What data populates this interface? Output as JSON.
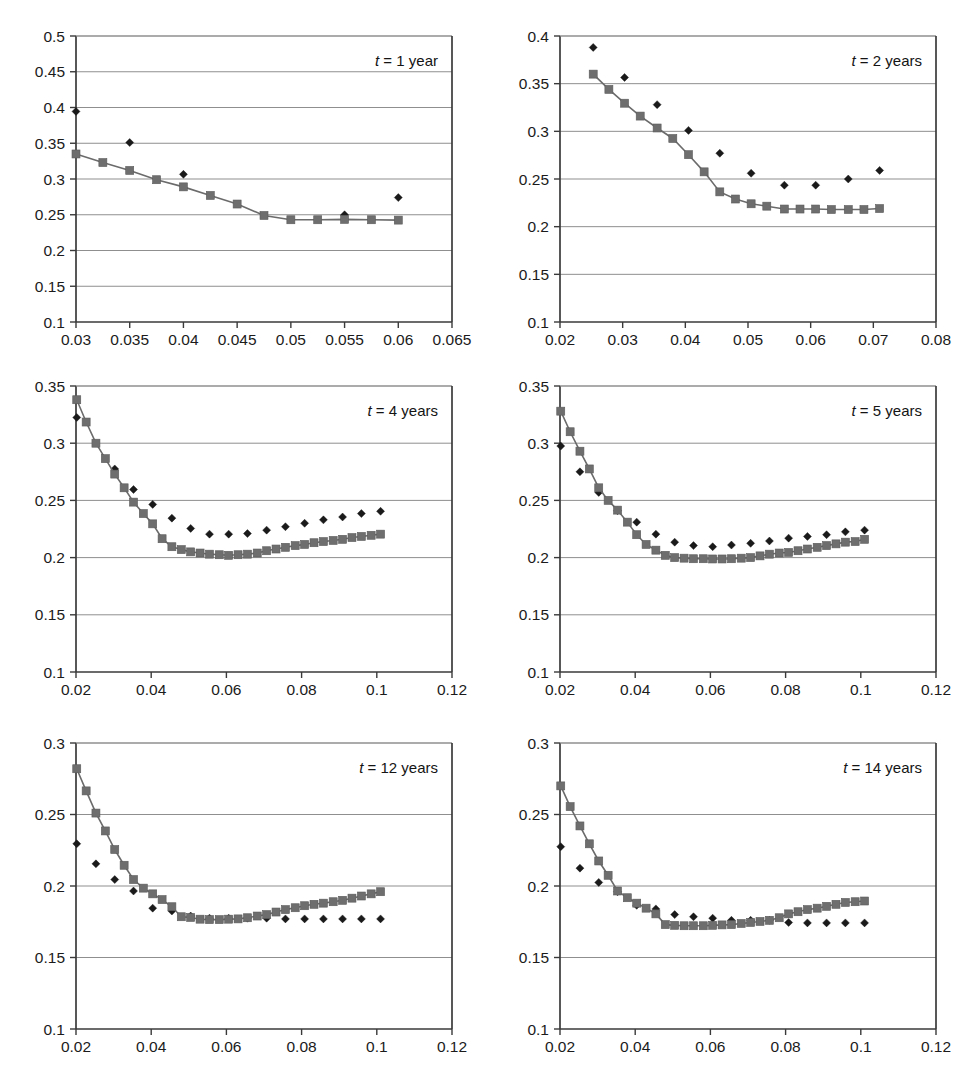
{
  "figure": {
    "kind": "multi-panel-scatter-line-figure",
    "panel_count": 6,
    "colors": {
      "diamond_series": "#1a1a1a",
      "square_series": "#6e6e6e",
      "line": "#6b6b6b",
      "gridline": "#8f8f8f",
      "axis": "#3a3a3a",
      "background": "#ffffff"
    }
  },
  "chart_data": [
    {
      "id": "panel-t-1-year",
      "type": "scatter",
      "title": "t = 1 year",
      "title_parts": {
        "symbol": "t",
        "rest": " = 1 year"
      },
      "xlabel": "",
      "ylabel": "",
      "xlim": [
        0.03,
        0.065
      ],
      "ylim": [
        0.1,
        0.5
      ],
      "xticks": [
        0.03,
        0.035,
        0.04,
        0.045,
        0.05,
        0.055,
        0.06,
        0.065
      ],
      "xtick_labels": [
        "0.03",
        "0.035",
        "0.04",
        "0.045",
        "0.05",
        "0.055",
        "0.06",
        "0.065"
      ],
      "yticks": [
        0.1,
        0.15,
        0.2,
        0.25,
        0.3,
        0.35,
        0.4,
        0.45,
        0.5
      ],
      "ytick_labels": [
        "0.1",
        "0.15",
        "0.2",
        "0.25",
        "0.3",
        "0.35",
        "0.4",
        "0.45",
        "0.5"
      ],
      "grid": true,
      "legend": "none",
      "series": [
        {
          "name": "market-implied",
          "marker": "diamond",
          "line": false,
          "x": [
            0.03,
            0.035,
            0.04,
            0.055,
            0.06
          ],
          "y": [
            0.3945,
            0.351,
            0.3065,
            0.25,
            0.274
          ]
        },
        {
          "name": "model-fit",
          "marker": "square",
          "line": true,
          "x": [
            0.03,
            0.0325,
            0.035,
            0.0375,
            0.04,
            0.0425,
            0.045,
            0.0475,
            0.05,
            0.0525,
            0.055,
            0.0575,
            0.06
          ],
          "y": [
            0.335,
            0.323,
            0.312,
            0.299,
            0.289,
            0.277,
            0.265,
            0.249,
            0.243,
            0.243,
            0.2435,
            0.243,
            0.2425
          ]
        }
      ]
    },
    {
      "id": "panel-t-2-years",
      "type": "scatter",
      "title": "t = 2 years",
      "title_parts": {
        "symbol": "t",
        "rest": " = 2 years"
      },
      "xlabel": "",
      "ylabel": "",
      "xlim": [
        0.02,
        0.08
      ],
      "ylim": [
        0.1,
        0.4
      ],
      "xticks": [
        0.02,
        0.03,
        0.04,
        0.05,
        0.06,
        0.07,
        0.08
      ],
      "xtick_labels": [
        "0.02",
        "0.03",
        "0.04",
        "0.05",
        "0.06",
        "0.07",
        "0.08"
      ],
      "yticks": [
        0.1,
        0.15,
        0.2,
        0.25,
        0.3,
        0.35,
        0.4
      ],
      "ytick_labels": [
        "0.1",
        "0.15",
        "0.2",
        "0.25",
        "0.3",
        "0.35",
        "0.4"
      ],
      "grid": true,
      "legend": "none",
      "series": [
        {
          "name": "market-implied",
          "marker": "diamond",
          "line": false,
          "x": [
            0.0253,
            0.0303,
            0.0355,
            0.0405,
            0.0455,
            0.0505,
            0.0558,
            0.0608,
            0.066,
            0.071
          ],
          "y": [
            0.388,
            0.3565,
            0.328,
            0.301,
            0.277,
            0.256,
            0.2435,
            0.2435,
            0.25,
            0.259
          ]
        },
        {
          "name": "model-fit",
          "marker": "square",
          "line": true,
          "x": [
            0.0253,
            0.0278,
            0.0303,
            0.0328,
            0.0355,
            0.038,
            0.0405,
            0.043,
            0.0455,
            0.048,
            0.0505,
            0.053,
            0.0558,
            0.0583,
            0.0608,
            0.0633,
            0.066,
            0.0685,
            0.071
          ],
          "y": [
            0.36,
            0.344,
            0.3295,
            0.316,
            0.3035,
            0.2925,
            0.2755,
            0.2575,
            0.2365,
            0.229,
            0.224,
            0.2215,
            0.2185,
            0.2185,
            0.2185,
            0.218,
            0.218,
            0.218,
            0.219
          ]
        }
      ]
    },
    {
      "id": "panel-t-4-years",
      "type": "scatter",
      "title": "t = 4 years",
      "title_parts": {
        "symbol": "t",
        "rest": " = 4 years"
      },
      "xlabel": "",
      "ylabel": "",
      "xlim": [
        0.02,
        0.12
      ],
      "ylim": [
        0.1,
        0.35
      ],
      "xticks": [
        0.02,
        0.04,
        0.06,
        0.08,
        0.1,
        0.12
      ],
      "xtick_labels": [
        "0.02",
        "0.04",
        "0.06",
        "0.08",
        "0.1",
        "0.12"
      ],
      "yticks": [
        0.1,
        0.15,
        0.2,
        0.25,
        0.3,
        0.35
      ],
      "ytick_labels": [
        "0.1",
        "0.15",
        "0.2",
        "0.25",
        "0.3",
        "0.35"
      ],
      "grid": true,
      "legend": "none",
      "series": [
        {
          "name": "market-implied",
          "marker": "diamond",
          "line": false,
          "x": [
            0.0202,
            0.0303,
            0.0353,
            0.0404,
            0.0455,
            0.0505,
            0.0555,
            0.0606,
            0.0656,
            0.0707,
            0.0757,
            0.0808,
            0.0858,
            0.0909,
            0.0959,
            0.101
          ],
          "y": [
            0.3225,
            0.2775,
            0.2595,
            0.2465,
            0.2345,
            0.2255,
            0.2205,
            0.2205,
            0.221,
            0.224,
            0.227,
            0.23,
            0.233,
            0.2355,
            0.2385,
            0.2405
          ]
        },
        {
          "name": "model-fit",
          "marker": "square",
          "line": true,
          "x": [
            0.0202,
            0.0227,
            0.0253,
            0.0278,
            0.0303,
            0.0328,
            0.0353,
            0.0379,
            0.0404,
            0.0429,
            0.0455,
            0.048,
            0.0505,
            0.053,
            0.0555,
            0.0581,
            0.0606,
            0.0631,
            0.0656,
            0.0682,
            0.0707,
            0.0732,
            0.0757,
            0.0783,
            0.0808,
            0.0833,
            0.0858,
            0.0884,
            0.0909,
            0.0934,
            0.0959,
            0.0985,
            0.101
          ],
          "y": [
            0.338,
            0.3185,
            0.3,
            0.2865,
            0.273,
            0.261,
            0.2485,
            0.2385,
            0.2295,
            0.2165,
            0.2095,
            0.207,
            0.205,
            0.204,
            0.203,
            0.2025,
            0.202,
            0.2025,
            0.203,
            0.204,
            0.206,
            0.2075,
            0.209,
            0.2105,
            0.2115,
            0.213,
            0.214,
            0.215,
            0.216,
            0.2175,
            0.2185,
            0.2195,
            0.2205
          ]
        }
      ]
    },
    {
      "id": "panel-t-5-years",
      "type": "scatter",
      "title": "t = 5 years",
      "title_parts": {
        "symbol": "t",
        "rest": " = 5 years"
      },
      "xlabel": "",
      "ylabel": "",
      "xlim": [
        0.02,
        0.12
      ],
      "ylim": [
        0.1,
        0.35
      ],
      "xticks": [
        0.02,
        0.04,
        0.06,
        0.08,
        0.1,
        0.12
      ],
      "xtick_labels": [
        "0.02",
        "0.04",
        "0.06",
        "0.08",
        "0.1",
        "0.12"
      ],
      "yticks": [
        0.1,
        0.15,
        0.2,
        0.25,
        0.3,
        0.35
      ],
      "ytick_labels": [
        "0.1",
        "0.15",
        "0.2",
        "0.25",
        "0.3",
        "0.35"
      ],
      "grid": true,
      "legend": "none",
      "series": [
        {
          "name": "market-implied",
          "marker": "diamond",
          "line": false,
          "x": [
            0.0202,
            0.0253,
            0.0303,
            0.0353,
            0.0404,
            0.0455,
            0.0505,
            0.0555,
            0.0606,
            0.0656,
            0.0707,
            0.0757,
            0.0808,
            0.0858,
            0.0909,
            0.0959,
            0.101
          ],
          "y": [
            0.2975,
            0.275,
            0.257,
            0.241,
            0.231,
            0.2205,
            0.2135,
            0.2105,
            0.2095,
            0.211,
            0.2125,
            0.2145,
            0.217,
            0.2185,
            0.22,
            0.2225,
            0.224
          ]
        },
        {
          "name": "model-fit",
          "marker": "square",
          "line": true,
          "x": [
            0.0202,
            0.0227,
            0.0253,
            0.0278,
            0.0303,
            0.0328,
            0.0353,
            0.0379,
            0.0404,
            0.0429,
            0.0455,
            0.048,
            0.0505,
            0.053,
            0.0555,
            0.0581,
            0.0606,
            0.0631,
            0.0656,
            0.0682,
            0.0707,
            0.0732,
            0.0757,
            0.0783,
            0.0808,
            0.0833,
            0.0858,
            0.0884,
            0.0909,
            0.0934,
            0.0959,
            0.0985,
            0.101
          ],
          "y": [
            0.328,
            0.31,
            0.293,
            0.2775,
            0.261,
            0.25,
            0.2415,
            0.231,
            0.22,
            0.2115,
            0.2065,
            0.202,
            0.2,
            0.1995,
            0.199,
            0.199,
            0.1988,
            0.1988,
            0.199,
            0.1995,
            0.2,
            0.2015,
            0.203,
            0.204,
            0.2045,
            0.206,
            0.2075,
            0.209,
            0.2105,
            0.212,
            0.2135,
            0.214,
            0.216
          ]
        }
      ]
    },
    {
      "id": "panel-t-12-years",
      "type": "scatter",
      "title": "t = 12 years",
      "title_parts": {
        "symbol": "t",
        "rest": " = 12 years"
      },
      "xlabel": "",
      "ylabel": "",
      "xlim": [
        0.02,
        0.12
      ],
      "ylim": [
        0.1,
        0.3
      ],
      "xticks": [
        0.02,
        0.04,
        0.06,
        0.08,
        0.1,
        0.12
      ],
      "xtick_labels": [
        "0.02",
        "0.04",
        "0.06",
        "0.08",
        "0.1",
        "0.12"
      ],
      "yticks": [
        0.1,
        0.15,
        0.2,
        0.25,
        0.3
      ],
      "ytick_labels": [
        "0.1",
        "0.15",
        "0.2",
        "0.25",
        "0.3"
      ],
      "grid": true,
      "legend": "none",
      "series": [
        {
          "name": "market-implied",
          "marker": "diamond",
          "line": false,
          "x": [
            0.0202,
            0.0253,
            0.0303,
            0.0353,
            0.0404,
            0.0455,
            0.0505,
            0.0555,
            0.0606,
            0.0656,
            0.0707,
            0.0757,
            0.0808,
            0.0858,
            0.0909,
            0.0959,
            0.101
          ],
          "y": [
            0.2295,
            0.2155,
            0.2045,
            0.1965,
            0.1845,
            0.1825,
            0.179,
            0.1775,
            0.1775,
            0.1775,
            0.1775,
            0.177,
            0.177,
            0.177,
            0.177,
            0.177,
            0.177
          ]
        },
        {
          "name": "model-fit",
          "marker": "square",
          "line": true,
          "x": [
            0.0202,
            0.0227,
            0.0253,
            0.0278,
            0.0303,
            0.0328,
            0.0353,
            0.0379,
            0.0404,
            0.0429,
            0.0455,
            0.048,
            0.0505,
            0.053,
            0.0555,
            0.0581,
            0.0606,
            0.0631,
            0.0656,
            0.0682,
            0.0707,
            0.0732,
            0.0757,
            0.0783,
            0.0808,
            0.0833,
            0.0858,
            0.0884,
            0.0909,
            0.0934,
            0.0959,
            0.0985,
            0.101
          ],
          "y": [
            0.282,
            0.2665,
            0.251,
            0.2385,
            0.2255,
            0.2145,
            0.2045,
            0.1985,
            0.1945,
            0.1905,
            0.1855,
            0.1785,
            0.178,
            0.1768,
            0.1765,
            0.1765,
            0.1768,
            0.177,
            0.1778,
            0.179,
            0.18,
            0.1818,
            0.1835,
            0.1848,
            0.1862,
            0.1872,
            0.188,
            0.189,
            0.19,
            0.1915,
            0.193,
            0.1945,
            0.196
          ]
        }
      ]
    },
    {
      "id": "panel-t-14-years",
      "type": "scatter",
      "title": "t = 14 years",
      "title_parts": {
        "symbol": "t",
        "rest": " = 14 years"
      },
      "xlabel": "",
      "ylabel": "",
      "xlim": [
        0.02,
        0.12
      ],
      "ylim": [
        0.1,
        0.3
      ],
      "xticks": [
        0.02,
        0.04,
        0.06,
        0.08,
        0.1,
        0.12
      ],
      "xtick_labels": [
        "0.02",
        "0.04",
        "0.06",
        "0.08",
        "0.1",
        "0.12"
      ],
      "yticks": [
        0.1,
        0.15,
        0.2,
        0.25,
        0.3
      ],
      "ytick_labels": [
        "0.1",
        "0.15",
        "0.2",
        "0.25",
        "0.3"
      ],
      "grid": true,
      "legend": "none",
      "series": [
        {
          "name": "market-implied",
          "marker": "diamond",
          "line": false,
          "x": [
            0.0202,
            0.0253,
            0.0303,
            0.0353,
            0.0404,
            0.0455,
            0.0505,
            0.0555,
            0.0606,
            0.0656,
            0.0707,
            0.0757,
            0.0808,
            0.0858,
            0.0909,
            0.0959,
            0.101
          ],
          "y": [
            0.2275,
            0.2125,
            0.2025,
            0.196,
            0.1865,
            0.184,
            0.18,
            0.1785,
            0.1775,
            0.176,
            0.176,
            0.176,
            0.1745,
            0.1742,
            0.1742,
            0.1742,
            0.1742
          ]
        },
        {
          "name": "model-fit",
          "marker": "square",
          "line": true,
          "x": [
            0.0202,
            0.0227,
            0.0253,
            0.0278,
            0.0303,
            0.0328,
            0.0353,
            0.0379,
            0.0404,
            0.0429,
            0.0455,
            0.048,
            0.0505,
            0.053,
            0.0555,
            0.0581,
            0.0606,
            0.0631,
            0.0656,
            0.0682,
            0.0707,
            0.0732,
            0.0757,
            0.0783,
            0.0808,
            0.0833,
            0.0858,
            0.0884,
            0.0909,
            0.0934,
            0.0959,
            0.0985,
            0.101
          ],
          "y": [
            0.27,
            0.2555,
            0.242,
            0.2295,
            0.2175,
            0.2075,
            0.1965,
            0.1918,
            0.188,
            0.1845,
            0.1805,
            0.173,
            0.1725,
            0.1722,
            0.1722,
            0.1722,
            0.1725,
            0.1728,
            0.173,
            0.1738,
            0.1745,
            0.1752,
            0.176,
            0.1778,
            0.1805,
            0.182,
            0.1835,
            0.1845,
            0.1858,
            0.1872,
            0.1885,
            0.189,
            0.1895
          ]
        }
      ]
    }
  ]
}
